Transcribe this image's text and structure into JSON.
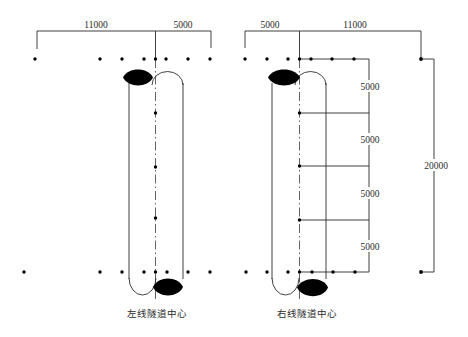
{
  "diagram": {
    "top_left": {
      "dim_a": "11000",
      "dim_b": "5000"
    },
    "top_right": {
      "dim_a": "5000",
      "dim_b": "11000"
    },
    "right_segments": [
      "5000",
      "5000",
      "5000",
      "5000"
    ],
    "total": "20000",
    "labels": {
      "left_tunnel": "左线隧道中心",
      "right_tunnel": "右线隧道中心"
    },
    "colors": {
      "line": "#2b2b2b",
      "marker": "#000000",
      "background": "#ffffff"
    }
  }
}
